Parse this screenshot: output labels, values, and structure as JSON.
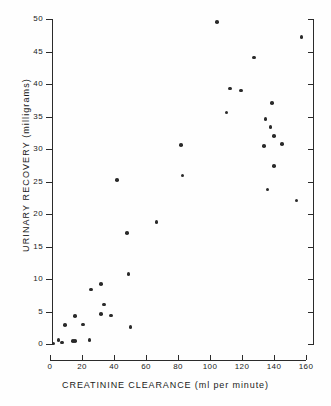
{
  "chart_data": {
    "type": "scatter",
    "title": "",
    "xlabel": "CREATININE CLEARANCE (ml per minute)",
    "ylabel": "URINARY RECOVERY (milligrams)",
    "xlim": [
      0,
      160
    ],
    "ylim": [
      0,
      50
    ],
    "xticks": [
      0,
      20,
      40,
      60,
      80,
      100,
      120,
      140,
      160
    ],
    "yticks": [
      0,
      5,
      10,
      15,
      20,
      25,
      30,
      35,
      40,
      45,
      50
    ],
    "xtick_labels": [
      "0",
      "20",
      "40",
      "60",
      "80",
      "100",
      "120",
      "140",
      "160"
    ],
    "ytick_labels": [
      "0",
      "5",
      "10",
      "15",
      "20",
      "25",
      "30",
      "35",
      "40",
      "45",
      "50"
    ],
    "grid": false,
    "legend": null,
    "marker": "filled-circle",
    "marker_color": "#2a2a2a",
    "points": [
      {
        "x": 1,
        "y": 0.1
      },
      {
        "x": 4,
        "y": 0.6
      },
      {
        "x": 6,
        "y": 0.2
      },
      {
        "x": 8,
        "y": 2.9
      },
      {
        "x": 13,
        "y": 0.5
      },
      {
        "x": 14,
        "y": 0.5
      },
      {
        "x": 14,
        "y": 4.3
      },
      {
        "x": 19,
        "y": 3.0
      },
      {
        "x": 23,
        "y": 0.6
      },
      {
        "x": 24,
        "y": 8.4
      },
      {
        "x": 30,
        "y": 9.2
      },
      {
        "x": 30,
        "y": 4.6
      },
      {
        "x": 32,
        "y": 6.1
      },
      {
        "x": 36,
        "y": 4.4
      },
      {
        "x": 40,
        "y": 25.2
      },
      {
        "x": 46,
        "y": 17.1
      },
      {
        "x": 47,
        "y": 10.8
      },
      {
        "x": 48,
        "y": 2.6
      },
      {
        "x": 64,
        "y": 18.8
      },
      {
        "x": 79,
        "y": 30.6
      },
      {
        "x": 80,
        "y": 25.9
      },
      {
        "x": 101,
        "y": 49.5
      },
      {
        "x": 107,
        "y": 35.6
      },
      {
        "x": 109,
        "y": 39.3
      },
      {
        "x": 116,
        "y": 39.0
      },
      {
        "x": 124,
        "y": 44.1
      },
      {
        "x": 130,
        "y": 30.5
      },
      {
        "x": 131,
        "y": 34.6
      },
      {
        "x": 132,
        "y": 23.8
      },
      {
        "x": 134,
        "y": 33.4
      },
      {
        "x": 135,
        "y": 37.1
      },
      {
        "x": 136,
        "y": 32.0
      },
      {
        "x": 136,
        "y": 27.4
      },
      {
        "x": 141,
        "y": 30.8
      },
      {
        "x": 150,
        "y": 22.1
      },
      {
        "x": 153,
        "y": 47.2
      }
    ]
  }
}
